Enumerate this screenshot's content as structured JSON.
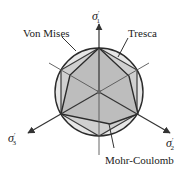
{
  "labels": {
    "von_mises": "Von Mises",
    "tresca": "Tresca",
    "mohr_coulomb": "Mohr-Coulomb"
  },
  "axes": {
    "s1": {
      "symbol": "σ",
      "prime": "′",
      "index": "1"
    },
    "s2": {
      "symbol": "σ",
      "prime": "′",
      "index": "2"
    },
    "s3": {
      "symbol": "σ",
      "prime": "′",
      "index": "3"
    }
  },
  "colors": {
    "line": "#333333",
    "fill": "#c8c8c8",
    "axis": "#555555"
  }
}
